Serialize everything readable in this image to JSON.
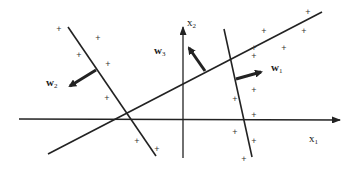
{
  "diagram": {
    "title": "",
    "axes": {
      "x": {
        "label": "x",
        "subscript": "1"
      },
      "y": {
        "label": "x",
        "subscript": "2"
      }
    },
    "weight_vectors": [
      {
        "name": "w",
        "subscript": "1"
      },
      {
        "name": "w",
        "subscript": "2"
      },
      {
        "name": "w",
        "subscript": "3"
      }
    ],
    "points": [
      {
        "x": 59,
        "y": 29,
        "symbol": "+"
      },
      {
        "x": 98,
        "y": 38,
        "symbol": "+"
      },
      {
        "x": 79,
        "y": 55,
        "symbol": "+"
      },
      {
        "x": 108,
        "y": 64,
        "symbol": "+"
      },
      {
        "x": 107,
        "y": 98,
        "symbol": "+"
      },
      {
        "x": 137,
        "y": 141,
        "symbol": "+"
      },
      {
        "x": 157,
        "y": 149,
        "symbol": "+"
      },
      {
        "x": 308,
        "y": 12,
        "symbol": "+"
      },
      {
        "x": 264,
        "y": 31,
        "symbol": "+"
      },
      {
        "x": 304,
        "y": 31,
        "symbol": "+"
      },
      {
        "x": 284,
        "y": 48,
        "symbol": "+"
      },
      {
        "x": 254,
        "y": 48,
        "symbol": "+"
      },
      {
        "x": 254,
        "y": 56,
        "symbol": "+"
      },
      {
        "x": 254,
        "y": 90,
        "symbol": "+"
      },
      {
        "x": 235,
        "y": 99,
        "symbol": "+"
      },
      {
        "x": 254,
        "y": 115,
        "symbol": "+"
      },
      {
        "x": 235,
        "y": 132,
        "symbol": "+"
      },
      {
        "x": 254,
        "y": 141,
        "symbol": "+"
      },
      {
        "x": 244,
        "y": 159,
        "symbol": "+"
      }
    ],
    "colors": {
      "line": "#222222",
      "background": "#ffffff"
    }
  }
}
